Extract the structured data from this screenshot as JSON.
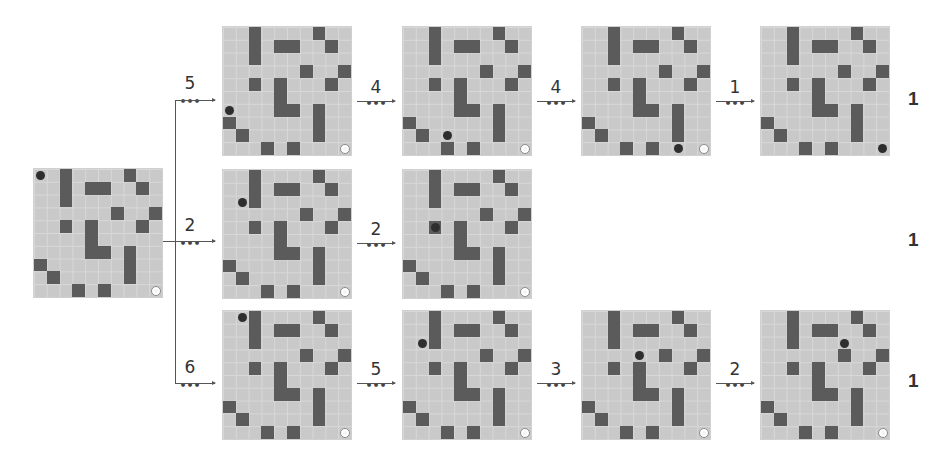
{
  "colors": {
    "cell": "#c9c9c9",
    "gridline": "#d8d8d8",
    "wall": "#5b5b5b",
    "agent": "#2e2e2e",
    "goal": "#ffffff"
  },
  "grid_size": 10,
  "walls": [
    [
      0,
      2
    ],
    [
      0,
      7
    ],
    [
      1,
      2
    ],
    [
      1,
      4
    ],
    [
      1,
      5
    ],
    [
      1,
      8
    ],
    [
      2,
      2
    ],
    [
      3,
      6
    ],
    [
      3,
      9
    ],
    [
      4,
      2
    ],
    [
      4,
      4
    ],
    [
      4,
      8
    ],
    [
      5,
      4
    ],
    [
      6,
      4
    ],
    [
      6,
      5
    ],
    [
      6,
      7
    ],
    [
      7,
      0
    ],
    [
      7,
      7
    ],
    [
      8,
      1
    ],
    [
      8,
      7
    ],
    [
      9,
      3
    ],
    [
      9,
      5
    ]
  ],
  "goal": [
    9,
    9
  ],
  "start": {
    "x": 34,
    "y": 169,
    "agent": [
      0,
      0
    ]
  },
  "rows": [
    {
      "branch_label": "5",
      "result": "1",
      "grids": [
        {
          "x": 223,
          "y": 27,
          "agent": [
            6,
            0
          ]
        },
        {
          "x": 403,
          "y": 27,
          "agent": [
            8,
            3
          ],
          "step_in": "4"
        },
        {
          "x": 582,
          "y": 27,
          "agent": [
            9,
            7
          ],
          "step_in": "4"
        },
        {
          "x": 761,
          "y": 27,
          "agent": [
            9,
            9
          ],
          "step_in": "1"
        }
      ]
    },
    {
      "branch_label": "2",
      "result": "1",
      "grids": [
        {
          "x": 223,
          "y": 170,
          "agent": [
            2,
            1
          ]
        },
        {
          "x": 403,
          "y": 170,
          "agent": [
            4,
            2
          ],
          "step_in": "2"
        }
      ]
    },
    {
      "branch_label": "6",
      "result": "1",
      "grids": [
        {
          "x": 223,
          "y": 311,
          "agent": [
            0,
            1
          ]
        },
        {
          "x": 403,
          "y": 311,
          "agent": [
            2,
            1
          ],
          "step_in": "5"
        },
        {
          "x": 582,
          "y": 311,
          "agent": [
            3,
            4
          ],
          "step_in": "3"
        },
        {
          "x": 761,
          "y": 311,
          "agent": [
            2,
            6
          ],
          "step_in": "2"
        }
      ]
    }
  ],
  "labels": {
    "row0_branch": "5",
    "row1_branch": "2",
    "row2_branch": "6",
    "row0_step1": "4",
    "row0_step2": "4",
    "row0_step3": "1",
    "row1_step1": "2",
    "row2_step1": "5",
    "row2_step2": "3",
    "row2_step3": "2",
    "ellipsis": "•••",
    "row0_result": "1",
    "row1_result": "1",
    "row2_result": "1"
  }
}
